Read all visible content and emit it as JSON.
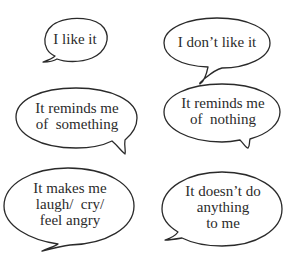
{
  "colors": {
    "background": "#ffffff",
    "stroke": "#2a2a2a",
    "text": "#2b2b2b"
  },
  "bubbles": [
    {
      "id": "i-like-it",
      "lines": [
        "I like it"
      ],
      "center": [
        75,
        40
      ],
      "font_size": 15
    },
    {
      "id": "i-dont-like-it",
      "lines": [
        "I don’t like it"
      ],
      "center": [
        217,
        43
      ],
      "font_size": 15
    },
    {
      "id": "reminds-something",
      "lines": [
        "It reminds me",
        "of  something"
      ],
      "center": [
        77,
        117
      ],
      "font_size": 15
    },
    {
      "id": "reminds-nothing",
      "lines": [
        "It reminds me",
        "of  nothing"
      ],
      "center": [
        223,
        112
      ],
      "font_size": 15
    },
    {
      "id": "makes-me-feel",
      "lines": [
        "It makes me",
        "laugh/  cry/",
        "feel angry"
      ],
      "center": [
        70,
        205
      ],
      "font_size": 15
    },
    {
      "id": "doesnt-do-anything",
      "lines": [
        "It doesn’t do",
        "anything",
        "to me"
      ],
      "center": [
        223,
        208
      ],
      "font_size": 15
    }
  ]
}
